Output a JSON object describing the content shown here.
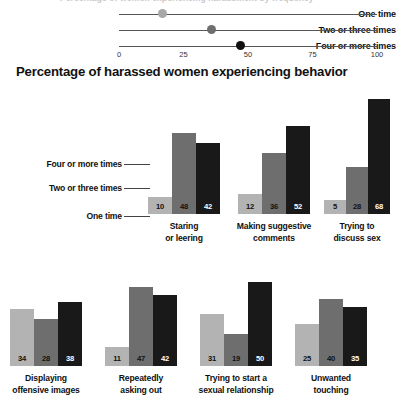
{
  "dotplot": {
    "cut_title": "Percentage of women experiencing harassment by frequency",
    "rows": [
      {
        "label": "One time",
        "value": 17,
        "color": "#a8a8a8"
      },
      {
        "label": "Two or three times",
        "value": 36,
        "color": "#6e6e6e"
      },
      {
        "label": "Four or more times",
        "value": 47,
        "color": "#111111"
      }
    ],
    "axis": {
      "min": 0,
      "max": 100,
      "ticks": [
        "0",
        "25",
        "50",
        "75",
        "100"
      ]
    }
  },
  "heading": "Percentage of harassed women experiencing behavior",
  "legend": {
    "items": [
      "Four or more times",
      "Two or three times",
      "One time"
    ]
  },
  "colors": {
    "one_time": "#b3b3b3",
    "two_or_three": "#6e6e6e",
    "four_or_more": "#191919",
    "value_on_light": "#111111",
    "value_on_dark": "#ffffff"
  },
  "chart_data": {
    "type": "bar",
    "title": "Percentage of harassed women experiencing behavior",
    "xlabel": "",
    "ylabel": "",
    "ylim": [
      0,
      70
    ],
    "grid": false,
    "legend_position": "inline-left",
    "series": [
      {
        "name": "One time",
        "color": "#b3b3b3"
      },
      {
        "name": "Two or three times",
        "color": "#6e6e6e"
      },
      {
        "name": "Four or more times",
        "color": "#191919"
      }
    ],
    "categories": [
      "Staring or leering",
      "Making suggestive comments",
      "Trying to discuss sex",
      "Displaying offensive images",
      "Repeatedly asking out",
      "Trying to start a sexual relationship",
      "Unwanted touching"
    ],
    "panels": [
      {
        "label_lines": [
          "Staring",
          "or leering"
        ],
        "values": [
          10,
          48,
          42
        ]
      },
      {
        "label_lines": [
          "Making suggestive",
          "comments"
        ],
        "values": [
          12,
          36,
          52
        ]
      },
      {
        "label_lines": [
          "Trying to",
          "discuss sex"
        ],
        "values": [
          5,
          28,
          68
        ]
      },
      {
        "label_lines": [
          "Displaying",
          "offensive images"
        ],
        "values": [
          34,
          28,
          38
        ]
      },
      {
        "label_lines": [
          "Repeatedly",
          "asking out"
        ],
        "values": [
          11,
          47,
          42
        ]
      },
      {
        "label_lines": [
          "Trying to start a",
          "sexual relationship"
        ],
        "values": [
          31,
          19,
          50
        ]
      },
      {
        "label_lines": [
          "Unwanted",
          "touching"
        ],
        "values": [
          25,
          40,
          35
        ]
      }
    ]
  }
}
